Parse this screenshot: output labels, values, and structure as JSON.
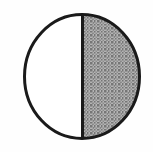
{
  "figure": {
    "description": "A circle divided by a vertical diameter into two equal halves; the right half is filled with a gray stipple pattern and the left half is unfilled white.",
    "fraction_shaded": "1/2",
    "shaded_parts": 1,
    "total_parts": 2,
    "shaded_percent": 50,
    "shape": "circle",
    "divider_orientation": "vertical",
    "shaded_side": "right",
    "unshaded_side": "left",
    "background_color": "#fefefe",
    "outline_color": "#1a1a1a",
    "outline_width_px": 3,
    "divider_color": "#1a1a1a",
    "divider_width_px": 3,
    "shade_fill_color": "#9a9a9a",
    "shade_pattern": "stipple-halftone",
    "shade_dot_color": "#6e6e6e",
    "unshaded_fill_color": "#ffffff",
    "geometry": {
      "center_x": 82,
      "center_y": 76.5,
      "radius_x": 59,
      "radius_y": 63.5,
      "bbox_left": 23,
      "bbox_top": 13,
      "bbox_right": 141,
      "bbox_bottom": 140,
      "canvas_width": 153,
      "canvas_height": 152
    }
  }
}
